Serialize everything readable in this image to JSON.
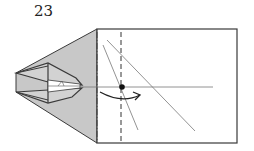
{
  "step": {
    "number": "23"
  },
  "diagram": {
    "colors": {
      "paper_back": "#c8c8c8",
      "paper_front": "#ffffff",
      "edge": "#3a3a3a",
      "reference_line": "#777777",
      "mark": "#111111"
    },
    "elements": [
      "folded-model-left-section",
      "rectangle-flap",
      "valley-fold-line-dashed",
      "mountain-fold-line-dash-dot",
      "horizontal-reference-line",
      "diagonal-reference-line-1",
      "diagonal-reference-line-2",
      "pivot-point-dot",
      "curved-fold-arrow"
    ]
  }
}
